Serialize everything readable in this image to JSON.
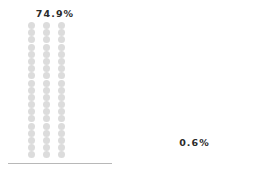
{
  "chart_data": {
    "type": "bar",
    "title": "",
    "subtitle": "",
    "xlabel": "",
    "ylabel": "",
    "categories": [
      "74.9%",
      "0.6%"
    ],
    "values": [
      74.9,
      0.6
    ],
    "unit": "percent",
    "grid": false,
    "legend": false,
    "axis_ranges": {
      "ylim": [
        0,
        100
      ]
    },
    "glyph": "dot",
    "series": [
      {
        "name": "74.9%",
        "value": 74.9,
        "label": "74.9%",
        "columns": 3,
        "rows": 19,
        "dot_color": "#dcdcdc",
        "label_color": "#2b2b2b",
        "clipped_fraction": 1.0
      },
      {
        "name": "0.6%",
        "value": 0.6,
        "label": "0.6%",
        "columns": 3,
        "rows": 1,
        "dot_color": "#4a4a4a",
        "label_color": "#2b2b2b",
        "clipped_fraction": 0.35
      }
    ]
  },
  "panels": {
    "left": {
      "label": "74.9%",
      "rows": 19,
      "columns": 3
    },
    "right": {
      "label": "0.6%",
      "rows": 1,
      "columns": 3
    }
  },
  "colors": {
    "background": "#ffffff",
    "dot_light": "#dcdcdc",
    "dot_dark": "#4a4a4a",
    "label_text": "#2b2b2b",
    "baseline": "#b8b8b8"
  }
}
